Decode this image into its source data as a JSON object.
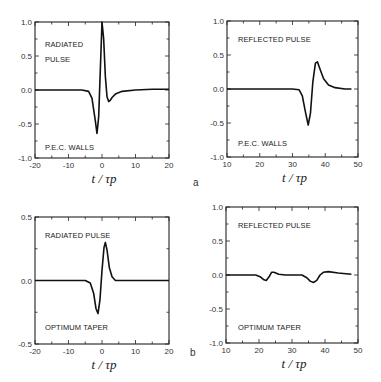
{
  "panel_labels": {
    "a": "a",
    "b": "b"
  },
  "xlabel": "t / τp",
  "chart_data": [
    {
      "type": "line",
      "panel": "a",
      "position": "top-left",
      "title": "RADIATED PULSE",
      "annotations": [
        "RADIATED",
        "PULSE",
        "P.E.C. WALLS"
      ],
      "xlabel": "t/τp",
      "ylabel": "",
      "xlim": [
        -20,
        20
      ],
      "ylim": [
        -1.0,
        1.0
      ],
      "xticks": [
        -20,
        -10,
        0,
        10,
        20
      ],
      "yticks": [
        1.0,
        0.5,
        0.0,
        -0.5,
        -1.0
      ],
      "ytick_labels": [
        "1.0",
        "0.5",
        "0.0",
        "-0.5",
        "-1.0"
      ],
      "grid": false,
      "x": [
        -20,
        -6,
        -4,
        -3,
        -2,
        -1.5,
        -1,
        -0.5,
        0,
        0.5,
        1,
        1.5,
        2,
        2.5,
        3,
        4,
        6,
        10,
        15,
        20
      ],
      "y": [
        0.0,
        0.0,
        -0.02,
        -0.12,
        -0.45,
        -0.64,
        -0.4,
        0.3,
        1.0,
        0.75,
        0.2,
        -0.1,
        -0.17,
        -0.15,
        -0.11,
        -0.06,
        -0.02,
        0.0,
        0.01,
        0.01
      ]
    },
    {
      "type": "line",
      "panel": "a",
      "position": "top-right",
      "title": "REFLECTED PULSE",
      "annotations": [
        "REFLECTED PULSE",
        "P.E.C. WALLS"
      ],
      "xlabel": "t/τp",
      "ylabel": "",
      "xlim": [
        10,
        50
      ],
      "ylim": [
        -1.0,
        1.0
      ],
      "xticks": [
        10,
        20,
        30,
        40,
        50
      ],
      "yticks": [
        1.0,
        0.5,
        0.0,
        -0.5,
        -1.0
      ],
      "ytick_labels": [
        "1.0",
        "0.5",
        "0.0",
        "-0.5",
        "-1.0"
      ],
      "grid": false,
      "x": [
        10,
        30,
        32,
        33,
        34,
        34.8,
        35.5,
        36.2,
        37,
        37.6,
        38.5,
        39.5,
        41,
        43,
        46,
        48
      ],
      "y": [
        0.0,
        0.0,
        -0.01,
        -0.1,
        -0.35,
        -0.53,
        -0.35,
        0.1,
        0.38,
        0.4,
        0.28,
        0.15,
        0.06,
        0.02,
        0.0,
        0.0
      ]
    },
    {
      "type": "line",
      "panel": "b",
      "position": "bottom-left",
      "title": "RADIATED PULSE",
      "annotations": [
        "RADIATED PULSE",
        "OPTIMUM TAPER"
      ],
      "xlabel": "t/τp",
      "ylabel": "",
      "xlim": [
        -20,
        20
      ],
      "ylim": [
        -0.5,
        0.5
      ],
      "xticks": [
        -20,
        -10,
        0,
        10,
        20
      ],
      "yticks": [
        0.5,
        0.0,
        -0.5
      ],
      "ytick_labels": [
        "0.5",
        "0.0",
        "-0.5"
      ],
      "grid": false,
      "x": [
        -20,
        -5,
        -3.5,
        -2.5,
        -1.8,
        -1.2,
        -0.6,
        0,
        0.6,
        1.0,
        1.5,
        2.2,
        3,
        4,
        6,
        20
      ],
      "y": [
        0.0,
        0.0,
        -0.02,
        -0.1,
        -0.22,
        -0.26,
        -0.15,
        0.08,
        0.26,
        0.3,
        0.24,
        0.1,
        0.03,
        0.0,
        0.0,
        0.0
      ]
    },
    {
      "type": "line",
      "panel": "b",
      "position": "bottom-right",
      "title": "REFLECTED PULSE",
      "annotations": [
        "REFLECTED PULSE",
        "OPTIMUM TAPER"
      ],
      "xlabel": "t/τp",
      "ylabel": "",
      "xlim": [
        10,
        50
      ],
      "ylim": [
        -1.0,
        1.0
      ],
      "xticks": [
        10,
        20,
        30,
        40,
        50
      ],
      "yticks": [
        1.0,
        0.5,
        0.0,
        -0.5,
        -1.0
      ],
      "ytick_labels": [
        "1.0",
        "0.5",
        "0.0",
        "-0.5",
        "-1.0"
      ],
      "grid": false,
      "x": [
        10,
        19,
        20.5,
        21.5,
        22.2,
        23,
        23.8,
        24.5,
        26,
        28,
        33,
        34.5,
        35.5,
        36.5,
        37.5,
        38.5,
        39.5,
        41,
        44,
        48
      ],
      "y": [
        0.0,
        0.0,
        -0.03,
        -0.07,
        -0.08,
        -0.03,
        0.04,
        0.04,
        0.01,
        0.0,
        0.0,
        -0.04,
        -0.09,
        -0.11,
        -0.08,
        0.0,
        0.04,
        0.05,
        0.03,
        0.01
      ]
    }
  ]
}
